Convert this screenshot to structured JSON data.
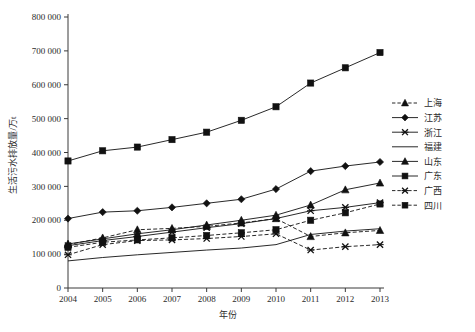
{
  "chart_data": {
    "type": "line",
    "title": "",
    "xlabel": "年份",
    "ylabel": "生活污水排放量/万t",
    "grid": false,
    "legend_position": "right",
    "x": [
      2004,
      2005,
      2006,
      2007,
      2008,
      2009,
      2010,
      2011,
      2012,
      2013
    ],
    "categories": [
      "2004",
      "2005",
      "2006",
      "2007",
      "2008",
      "2009",
      "2010",
      "2011",
      "2012",
      "2013"
    ],
    "xlim": [
      2004,
      2013
    ],
    "ylim": [
      0,
      800000
    ],
    "ytick_values": [
      0,
      100000,
      200000,
      300000,
      400000,
      500000,
      600000,
      700000,
      800000
    ],
    "ytick_labels": [
      "0",
      "100 000",
      "200 000",
      "300 000",
      "400 000",
      "500 000",
      "600 000",
      "700 000",
      "800 000"
    ],
    "series": [
      {
        "name": "上海",
        "marker": "triangle",
        "line": "dashed",
        "values": [
          128000,
          148000,
          172000,
          176000,
          182000,
          192000,
          205000,
          152000,
          163000,
          170000
        ]
      },
      {
        "name": "江苏",
        "marker": "diamond",
        "line": "solid",
        "values": [
          205000,
          224000,
          228000,
          238000,
          250000,
          262000,
          292000,
          345000,
          360000,
          372000
        ]
      },
      {
        "name": "浙江",
        "marker": "cross",
        "line": "solid",
        "values": [
          125000,
          140000,
          152000,
          165000,
          178000,
          190000,
          205000,
          228000,
          238000,
          252000
        ]
      },
      {
        "name": "福建",
        "marker": "none",
        "line": "solid",
        "values": [
          80000,
          90000,
          98000,
          105000,
          112000,
          118000,
          128000,
          158000,
          168000,
          175000
        ]
      },
      {
        "name": "山东",
        "marker": "triangle",
        "line": "solid",
        "values": [
          130000,
          145000,
          160000,
          172000,
          186000,
          200000,
          215000,
          245000,
          290000,
          310000
        ]
      },
      {
        "name": "广东",
        "marker": "square",
        "line": "solid",
        "values": [
          375000,
          405000,
          416000,
          438000,
          460000,
          495000,
          535000,
          605000,
          650000,
          695000
        ]
      },
      {
        "name": "广西",
        "marker": "cross",
        "line": "dashed",
        "values": [
          98000,
          128000,
          140000,
          142000,
          146000,
          152000,
          160000,
          112000,
          122000,
          128000
        ]
      },
      {
        "name": "四川",
        "marker": "square",
        "line": "dashed",
        "values": [
          120000,
          135000,
          142000,
          148000,
          155000,
          163000,
          172000,
          200000,
          222000,
          248000
        ]
      }
    ]
  },
  "plot": {
    "axis_color": "#3a3a3a",
    "series_color": "#111111"
  }
}
